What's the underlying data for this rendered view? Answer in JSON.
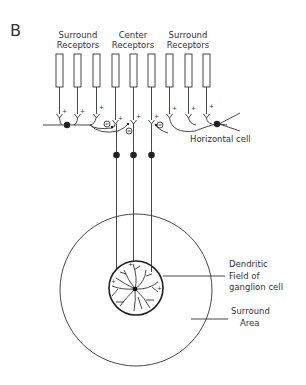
{
  "panel_label": "B",
  "receptor_groups": [
    {
      "line1": "Surround",
      "line2": "Receptors"
    },
    {
      "line1": "Center",
      "line2": "Receptors"
    },
    {
      "line1": "Surround",
      "line2": "Receptors"
    }
  ],
  "horizontal_cell_label": "Horizontal cell",
  "dendritic_label": {
    "line1": "Dendritic",
    "line2": "Field of",
    "line3": "ganglion cell"
  },
  "surround_area_label": {
    "line1": "Surround",
    "line2": "Area"
  },
  "signs": {
    "plus": "+",
    "minus": "−"
  },
  "colors": {
    "ink": "#333333",
    "background": "#ffffff"
  }
}
